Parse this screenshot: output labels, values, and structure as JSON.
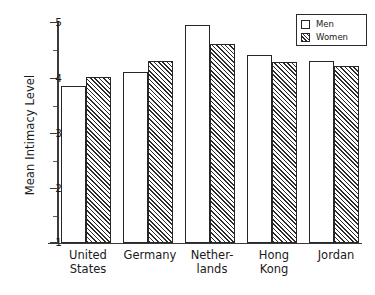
{
  "chart_data": {
    "type": "bar",
    "title": "",
    "xlabel": "",
    "ylabel": "Mean Intimacy Level",
    "ylim": [
      1,
      5
    ],
    "yticks": [
      1,
      2,
      3,
      4,
      5
    ],
    "ytick_labels": [
      "1",
      "2",
      "3",
      "4",
      "5"
    ],
    "minor_ticks": [
      1.5,
      2.5,
      3.5,
      4.5
    ],
    "grid": false,
    "legend_position": "top-right",
    "categories": [
      "United\nStates",
      "Germany",
      "Nether-\nlands",
      "Hong\nKong",
      "Jordan"
    ],
    "series": [
      {
        "name": "Men",
        "values": [
          3.85,
          4.1,
          4.95,
          4.4,
          4.3
        ]
      },
      {
        "name": "Women",
        "values": [
          4.0,
          4.3,
          4.6,
          4.27,
          4.2
        ]
      }
    ]
  },
  "legend": {
    "items": [
      {
        "label": "Men",
        "swatch": "empty-square-swatch"
      },
      {
        "label": "Women",
        "swatch": "hatched-square-swatch"
      }
    ]
  },
  "axis": {
    "y_title": "Mean Intimacy Level",
    "tick_5": "5",
    "tick_4": "4",
    "tick_3": "3",
    "tick_2": "2",
    "tick_1": "1"
  },
  "categories_text": {
    "united_states": "United\nStates",
    "germany": "Germany",
    "netherlands": "Nether-\nlands",
    "hong_kong": "Hong\nKong",
    "jordan": "Jordan"
  },
  "colors": {
    "ink": "#1a1a1a",
    "axis": "#3a3a3a",
    "bar_outline": "#262626",
    "hatch": "#2b2b2b",
    "background": "#ffffff"
  }
}
